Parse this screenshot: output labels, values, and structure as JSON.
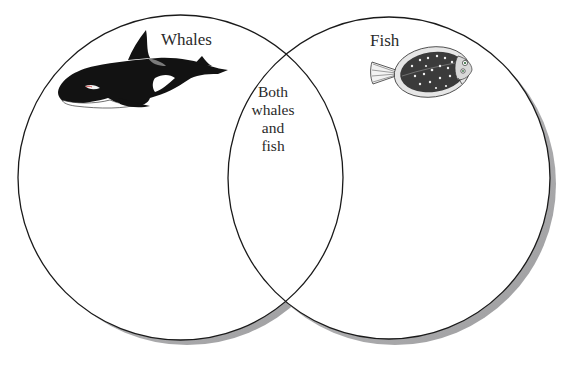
{
  "diagram": {
    "type": "venn",
    "sets": [
      {
        "id": "whales",
        "label": "Whales",
        "icon": "orca-whale-icon"
      },
      {
        "id": "fish",
        "label": "Fish",
        "icon": "flounder-fish-icon"
      }
    ],
    "intersection": {
      "label_lines": [
        "Both",
        "whales",
        "and",
        "fish"
      ]
    },
    "colors": {
      "outline": "#1a1a1a",
      "shadow": "#a8a8aa",
      "fill": "#ffffff"
    }
  }
}
